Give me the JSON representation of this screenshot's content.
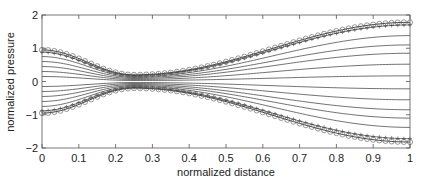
{
  "chart_data": {
    "type": "line",
    "title": "",
    "xlabel": "normalized distance",
    "ylabel": "normalized pressure",
    "xlim": [
      0,
      1
    ],
    "ylim": [
      -2,
      2
    ],
    "xticks": [
      0,
      0.1,
      0.2,
      0.3,
      0.4,
      0.5,
      0.6,
      0.7,
      0.8,
      0.9,
      1
    ],
    "xtick_labels": [
      "0",
      "0.1",
      "0.2",
      "0.3",
      "0.4",
      "0.5",
      "0.6",
      "0.7",
      "0.8",
      "0.9",
      "1"
    ],
    "yticks": [
      -2,
      -1,
      0,
      1,
      2
    ],
    "ytick_labels": [
      "-2",
      "-1",
      "0",
      "1",
      "2"
    ],
    "grid": false,
    "legend": null,
    "pinch_x": 0.25,
    "series": [
      {
        "name": "upper envelope",
        "marker": "o",
        "start": 0.95,
        "pinch": 0.2,
        "end": 1.78
      },
      {
        "name": "line 1",
        "marker": "+",
        "start": 0.88,
        "pinch": 0.18,
        "end": 1.7
      },
      {
        "name": "line 2",
        "marker": "none",
        "start": 0.75,
        "pinch": 0.15,
        "end": 1.38
      },
      {
        "name": "line 3",
        "marker": "none",
        "start": 0.6,
        "pinch": 0.12,
        "end": 1.1
      },
      {
        "name": "line 4",
        "marker": "none",
        "start": 0.45,
        "pinch": 0.09,
        "end": 0.85
      },
      {
        "name": "line 5",
        "marker": "none",
        "start": 0.3,
        "pinch": 0.06,
        "end": 0.52
      },
      {
        "name": "line 6",
        "marker": "none",
        "start": 0.15,
        "pinch": 0.03,
        "end": 0.17
      },
      {
        "name": "line 7",
        "marker": "none",
        "start": -0.15,
        "pinch": -0.03,
        "end": -0.22
      },
      {
        "name": "line 8",
        "marker": "none",
        "start": -0.3,
        "pinch": -0.06,
        "end": -0.55
      },
      {
        "name": "line 9",
        "marker": "none",
        "start": -0.45,
        "pinch": -0.09,
        "end": -0.85
      },
      {
        "name": "line 10",
        "marker": "none",
        "start": -0.6,
        "pinch": -0.12,
        "end": -1.1
      },
      {
        "name": "line 11",
        "marker": "none",
        "start": -0.75,
        "pinch": -0.15,
        "end": -1.38
      },
      {
        "name": "line 12",
        "marker": "+",
        "start": -0.88,
        "pinch": -0.18,
        "end": -1.72
      },
      {
        "name": "lower envelope",
        "marker": "o",
        "start": -0.95,
        "pinch": -0.2,
        "end": -1.82
      }
    ]
  }
}
